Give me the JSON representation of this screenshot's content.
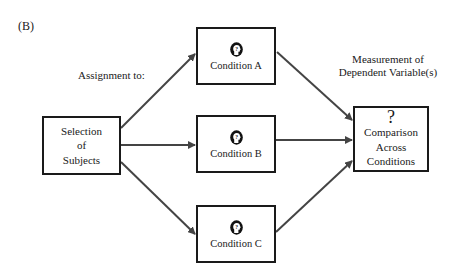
{
  "panel_label": "(B)",
  "labels": {
    "assignment": "Assignment to:",
    "measurement_line1": "Measurement of",
    "measurement_line2": "Dependent Variable(s)"
  },
  "selection_box": {
    "line1": "Selection",
    "line2": "of",
    "line3": "Subjects"
  },
  "conditions": [
    {
      "label": "Condition A",
      "icon": "head-question-icon"
    },
    {
      "label": "Condition B",
      "icon": "head-question-icon"
    },
    {
      "label": "Condition C",
      "icon": "head-question-icon"
    }
  ],
  "comparison_box": {
    "symbol": "?",
    "line1": "Comparison",
    "line2": "Across",
    "line3": "Conditions"
  },
  "colors": {
    "box_border": "#1a1a1a",
    "arrow": "#444444",
    "background": "#ffffff"
  }
}
